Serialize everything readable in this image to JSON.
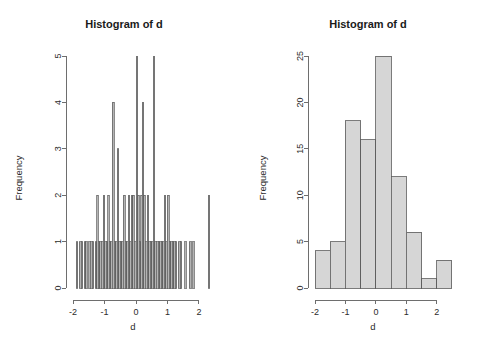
{
  "figure": {
    "background": "#ffffff",
    "panel_count": 2
  },
  "chart_data": [
    {
      "type": "bar",
      "panel": "left",
      "title": "Histogram of d",
      "xlabel": "d",
      "ylabel": "Frequency",
      "xlim": [
        -2.1,
        2.45
      ],
      "ylim": [
        0,
        5
      ],
      "xticks": [
        -2,
        -1,
        0,
        1,
        2
      ],
      "xtick_labels": [
        "-2",
        "-1",
        "0",
        "1",
        "2"
      ],
      "yticks": [
        0,
        1,
        2,
        3,
        4,
        5
      ],
      "ytick_labels": [
        "0",
        "1",
        "2",
        "3",
        "4",
        "5"
      ],
      "grid": false,
      "legend": "none",
      "bin_width": 0.05,
      "bin_starts": [
        -1.9,
        -1.85,
        -1.8,
        -1.75,
        -1.7,
        -1.65,
        -1.6,
        -1.55,
        -1.5,
        -1.45,
        -1.4,
        -1.35,
        -1.3,
        -1.25,
        -1.2,
        -1.15,
        -1.1,
        -1.05,
        -1.0,
        -0.95,
        -0.9,
        -0.85,
        -0.8,
        -0.75,
        -0.7,
        -0.65,
        -0.6,
        -0.55,
        -0.5,
        -0.45,
        -0.4,
        -0.35,
        -0.3,
        -0.25,
        -0.2,
        -0.15,
        -0.1,
        -0.05,
        0.0,
        0.05,
        0.1,
        0.15,
        0.2,
        0.25,
        0.3,
        0.35,
        0.4,
        0.45,
        0.5,
        0.55,
        0.6,
        0.65,
        0.7,
        0.75,
        0.8,
        0.85,
        0.9,
        0.95,
        1.0,
        1.05,
        1.1,
        1.15,
        1.2,
        1.25,
        1.3,
        1.35,
        1.4,
        1.45,
        1.5,
        1.55,
        1.6,
        1.65,
        1.7,
        1.75,
        1.8,
        1.85,
        1.9,
        1.95,
        2.0,
        2.05,
        2.1,
        2.15,
        2.2,
        2.25,
        2.3
      ],
      "values": [
        1,
        0,
        1,
        1,
        0,
        1,
        1,
        0,
        1,
        1,
        1,
        0,
        1,
        2,
        1,
        1,
        1,
        2,
        1,
        1,
        2,
        1,
        1,
        4,
        1,
        1,
        3,
        1,
        1,
        1,
        2,
        1,
        1,
        2,
        1,
        2,
        2,
        1,
        5,
        2,
        1,
        2,
        4,
        2,
        1,
        2,
        1,
        1,
        1,
        5,
        1,
        1,
        1,
        1,
        1,
        1,
        2,
        1,
        2,
        1,
        1,
        1,
        1,
        1,
        0,
        1,
        1,
        0,
        0,
        1,
        0,
        0,
        1,
        0,
        1,
        0,
        0,
        0,
        0,
        0,
        0,
        0,
        0,
        0,
        2
      ],
      "bar_fill": "#b4b4b4",
      "bar_stroke": "#5a5a5a"
    },
    {
      "type": "bar",
      "panel": "right",
      "title": "Histogram of d",
      "xlabel": "d",
      "ylabel": "Frequency",
      "xlim": [
        -2.1,
        2.6
      ],
      "ylim": [
        0,
        25
      ],
      "xticks": [
        -2,
        -1,
        0,
        1,
        2
      ],
      "xtick_labels": [
        "-2",
        "-1",
        "0",
        "1",
        "2"
      ],
      "yticks": [
        0,
        5,
        10,
        15,
        20,
        25
      ],
      "ytick_labels": [
        "0",
        "5",
        "10",
        "15",
        "20",
        "25"
      ],
      "grid": false,
      "legend": "none",
      "bin_width": 0.5,
      "bin_starts": [
        -2.0,
        -1.5,
        -1.0,
        -0.5,
        0.0,
        0.5,
        1.0,
        1.5,
        2.0
      ],
      "bin_ends": [
        -1.5,
        -1.0,
        -0.5,
        0.0,
        0.5,
        1.0,
        1.5,
        2.0,
        2.5
      ],
      "bin_labels": [
        "[-2.0,-1.5)",
        "[-1.5,-1.0)",
        "[-1.0,-0.5)",
        "[-0.5,0.0)",
        "[0.0,0.5)",
        "[0.5,1.0)",
        "[1.0,1.5)",
        "[1.5,2.0)",
        "[2.0,2.5)"
      ],
      "values": [
        4,
        5,
        18,
        16,
        25,
        12,
        6,
        1,
        3
      ],
      "bar_fill": "#d6d6d6",
      "bar_stroke": "#5a5a5a"
    }
  ]
}
